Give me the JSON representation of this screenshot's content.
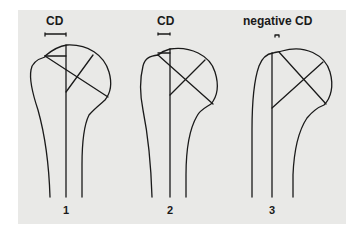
{
  "figures": [
    {
      "label": "CD",
      "number": "1"
    },
    {
      "label": "CD",
      "number": "2"
    },
    {
      "label": "negative CD",
      "number": "3"
    }
  ],
  "colors": {
    "background": "#e9e9e7",
    "ink": "#1a1a1a",
    "page": "#ffffff"
  }
}
